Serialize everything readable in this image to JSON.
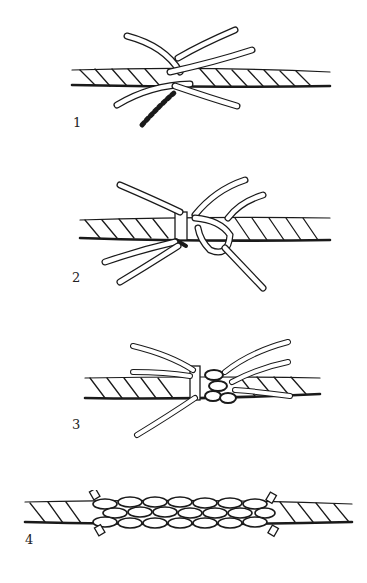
{
  "figure": {
    "steps": [
      {
        "number": "1",
        "description": "Unlaid strands of two rope ends interlocked"
      },
      {
        "number": "2",
        "description": "Strands seized and first tuck made"
      },
      {
        "number": "3",
        "description": "Tucks continued around the rope"
      },
      {
        "number": "4",
        "description": "Completed splice with strand ends trimmed"
      }
    ]
  },
  "colors": {
    "ink": "#1a1a1a",
    "paper": "#ffffff"
  }
}
